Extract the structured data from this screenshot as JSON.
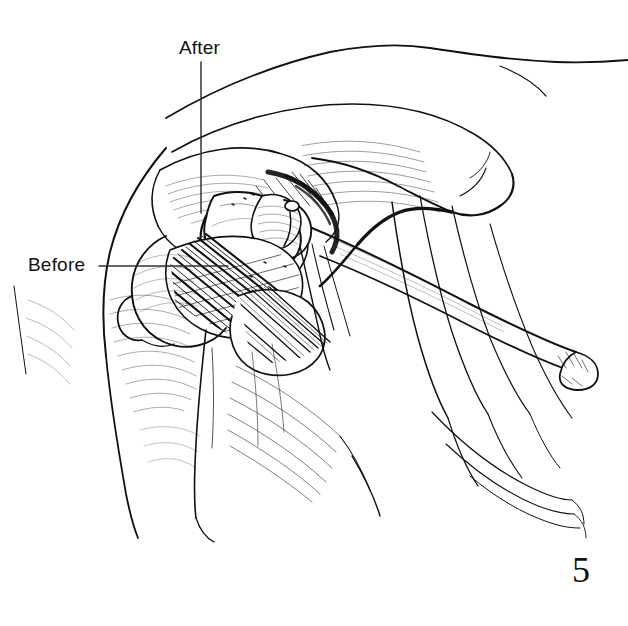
{
  "figure": {
    "number": "5",
    "background_color": "#ffffff",
    "ink_color": "#111111",
    "width": 628,
    "height": 626
  },
  "labels": [
    {
      "id": "after",
      "text": "After",
      "x": 179,
      "y": 38,
      "leader": {
        "type": "vertical",
        "x": 201,
        "y_start": 62,
        "y_end": 213
      }
    },
    {
      "id": "before",
      "text": "Before",
      "x": 28,
      "y": 255,
      "leader": {
        "type": "horizontal",
        "y": 266,
        "x_start": 99,
        "x_end": 228
      }
    }
  ],
  "annotations": {
    "after_label": "After",
    "before_label": "Before",
    "figure_number": "5"
  }
}
